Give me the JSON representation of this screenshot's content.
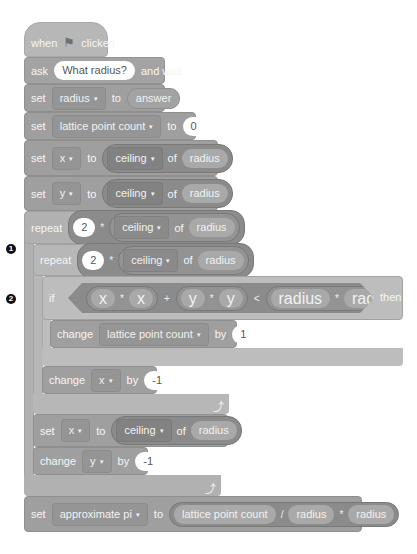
{
  "script": {
    "hat": {
      "when": "when",
      "flag_icon": "green-flag-icon",
      "clicked": "clicked"
    },
    "ask": {
      "keyword": "ask",
      "prompt": "What radius?",
      "suffix": "and wait"
    },
    "set_radius": {
      "keyword": "set",
      "variable": "radius",
      "to": "to",
      "value": "answer"
    },
    "set_lattice": {
      "keyword": "set",
      "variable": "lattice point count",
      "to": "to",
      "value": "0"
    },
    "set_x": {
      "keyword": "set",
      "variable": "x",
      "to": "to",
      "func": "ceiling",
      "of": "of",
      "arg": "radius"
    },
    "set_y": {
      "keyword": "set",
      "variable": "y",
      "to": "to",
      "func": "ceiling",
      "of": "of",
      "arg": "radius"
    },
    "repeat_outer": {
      "keyword": "repeat",
      "factor": "2",
      "times": "*",
      "func": "ceiling",
      "of": "of",
      "arg": "radius",
      "marker": "1"
    },
    "repeat_inner": {
      "keyword": "repeat",
      "factor": "2",
      "times": "*",
      "func": "ceiling",
      "of": "of",
      "arg": "radius",
      "marker": "2"
    },
    "if_block": {
      "keyword": "if",
      "condition": {
        "a": "x",
        "op1": "*",
        "b": "x",
        "plus": "+",
        "c": "y",
        "op2": "*",
        "d": "y",
        "lt": "<",
        "e": "radius",
        "op3": "*",
        "f": "radius"
      },
      "then": "then"
    },
    "change_lattice": {
      "keyword": "change",
      "variable": "lattice point count",
      "by": "by",
      "value": "1"
    },
    "change_x": {
      "keyword": "change",
      "variable": "x",
      "by": "by",
      "value": "-1"
    },
    "reset_x": {
      "keyword": "set",
      "variable": "x",
      "to": "to",
      "func": "ceiling",
      "of": "of",
      "arg": "radius"
    },
    "change_y": {
      "keyword": "change",
      "variable": "y",
      "by": "by",
      "value": "-1"
    },
    "set_pi": {
      "keyword": "set",
      "variable": "approximate pi",
      "to": "to",
      "numerator": "lattice point count",
      "divide": "/",
      "a": "radius",
      "times": "*",
      "b": "radius"
    }
  },
  "icons": {
    "dropdown": "▾",
    "loop_arrow": "⤴",
    "flag": "⚑"
  }
}
